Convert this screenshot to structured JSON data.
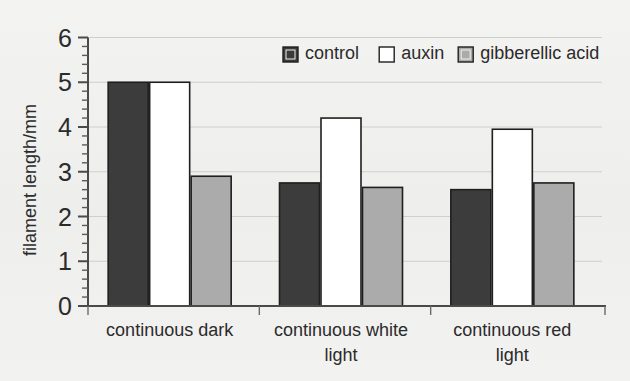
{
  "chart_data": {
    "type": "bar",
    "title": "",
    "xlabel": "",
    "ylabel": "filament length/mm",
    "categories": [
      "continuous dark",
      "continuous white light",
      "continuous red light"
    ],
    "series": [
      {
        "name": "control",
        "values": [
          5.0,
          2.75,
          2.6
        ],
        "color": "#3c3c3c"
      },
      {
        "name": "auxin",
        "values": [
          5.0,
          4.2,
          3.95
        ],
        "color": "#ffffff"
      },
      {
        "name": "gibberellic acid",
        "values": [
          2.9,
          2.65,
          2.75
        ],
        "color": "#ababab"
      }
    ],
    "ylim": [
      0,
      6
    ],
    "ytick_labels": [
      "0",
      "1",
      "2",
      "3",
      "4",
      "5",
      "6"
    ],
    "ytick_values": [
      0,
      1,
      2,
      3,
      4,
      5,
      6
    ],
    "minor_tick_step": 0.2,
    "grid": true,
    "grid_axis": "y",
    "legend_position": "top-right",
    "legend_entries": [
      "control",
      "auxin",
      "gibberellic acid"
    ]
  },
  "colors": {
    "background": "#f1f1ef",
    "control": "#3c3c3c",
    "auxin": "#ffffff",
    "gibberellic_acid": "#ababab",
    "bar_outline": "#1f1f1f",
    "axis": "#4a4a4a",
    "gridline": "#cfcfcd",
    "text": "#2b2b2b"
  },
  "category_label_lines": [
    [
      "continuous dark"
    ],
    [
      "continuous white",
      "light"
    ],
    [
      "continuous red",
      "light"
    ]
  ]
}
